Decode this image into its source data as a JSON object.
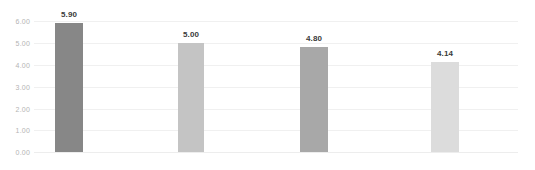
{
  "chart_data": {
    "type": "bar",
    "title": "",
    "subtitle": "",
    "xlabel": "",
    "ylabel": "",
    "categories": [
      "",
      "",
      "",
      ""
    ],
    "values": [
      5.9,
      5.0,
      4.8,
      4.14
    ],
    "data_labels": [
      "5.90",
      "5.00",
      "4.80",
      "4.14"
    ],
    "bar_colors": [
      "#878787",
      "#c4c4c4",
      "#a8a8a8",
      "#dcdcdc"
    ],
    "ylim": [
      0,
      6
    ],
    "ytick_values": [
      0,
      1,
      2,
      3,
      4,
      5,
      6
    ],
    "ytick_labels": [
      "0.00",
      "1.00",
      "2.00",
      "3.00",
      "4.00",
      "5.00",
      "6.00"
    ],
    "grid": true,
    "grid_color": "#f0f0f0",
    "legend": false,
    "legend_position": "none",
    "background_color": "#ffffff",
    "label_color": "#3a3a3a",
    "tick_label_color": "#b4b4b4",
    "bars": [
      {
        "label": "5.90",
        "value": 5.9,
        "color": "#878787",
        "x": 55,
        "width": 28
      },
      {
        "label": "5.00",
        "value": 5.0,
        "color": "#c4c4c4",
        "x": 178,
        "width": 26
      },
      {
        "label": "4.80",
        "value": 4.8,
        "color": "#a8a8a8",
        "x": 300,
        "width": 28
      },
      {
        "label": "4.14",
        "value": 4.14,
        "color": "#dcdcdc",
        "x": 431,
        "width": 28
      }
    ]
  }
}
